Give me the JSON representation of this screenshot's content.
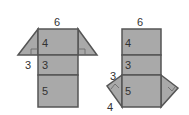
{
  "figures": [
    {
      "name": "net-left",
      "top_label": "6",
      "face_labels": [
        "4",
        "3",
        "5"
      ],
      "side_label": "3"
    },
    {
      "name": "net-right",
      "top_label": "6",
      "face_labels": [
        "4",
        "3",
        "5"
      ],
      "side_labels": [
        "3",
        "4"
      ]
    }
  ],
  "colors": {
    "face_fill": "#a9a9a9",
    "edge": "#555555",
    "text": "#333333"
  }
}
